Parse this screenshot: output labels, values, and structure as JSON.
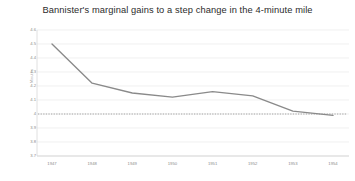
{
  "chart_data": {
    "type": "line",
    "title": "Bannister's marginal gains to a step change in the 4-minute mile",
    "xlabel": "",
    "ylabel": "Minutes",
    "categories": [
      "1947",
      "1948",
      "1949",
      "1950",
      "1951",
      "1952",
      "1953",
      "1954"
    ],
    "x": [
      1947,
      1948,
      1949,
      1950,
      1951,
      1952,
      1953,
      1954
    ],
    "values": [
      4.5,
      4.22,
      4.15,
      4.12,
      4.16,
      4.13,
      4.02,
      3.99
    ],
    "series": [
      {
        "name": "Mile record time",
        "values": [
          4.5,
          4.22,
          4.15,
          4.12,
          4.16,
          4.13,
          4.02,
          3.99
        ],
        "color": "#8a8a8a"
      }
    ],
    "reference_line": {
      "label": "4-minute barrier",
      "value": 4.0,
      "style": "dotted",
      "color": "#9a9a9a"
    },
    "ylim": [
      3.7,
      4.6
    ],
    "ytick_values": [
      4.6,
      4.5,
      4.4,
      4.3,
      4.2,
      4.1,
      4.0,
      3.9,
      3.8,
      3.7
    ],
    "ytick_labels": [
      "4.6",
      "4.5",
      "4.4",
      "4.3",
      "4.2",
      "4.1",
      "4",
      "3.9",
      "3.8",
      "3.7"
    ],
    "grid": true,
    "grid_color": "#e9e9e9",
    "legend": false,
    "background": "#ffffff"
  }
}
